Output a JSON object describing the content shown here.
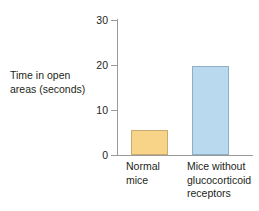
{
  "chart_data": {
    "type": "bar",
    "title": "",
    "xlabel": "",
    "ylabel": "Time in open\nareas (seconds)",
    "categories": [
      "Normal\nmice",
      "Mice without\nglucocorticoid\nreceptors"
    ],
    "category_names": [
      "Normal mice",
      "Mice without glucocorticoid receptors"
    ],
    "values": [
      5.5,
      19.8
    ],
    "ylim": [
      0,
      30
    ],
    "yticks": [
      0,
      10,
      20,
      30
    ],
    "ytick_labels": [
      "0",
      "10",
      "20",
      "30"
    ],
    "grid": false,
    "legend": false,
    "bar_colors": [
      "#f7d488",
      "#b9d9ef"
    ],
    "bar_border_colors": [
      "#c9ab72",
      "#8fafc6"
    ],
    "axis_color": "#9a9a9a",
    "text_color": "#231f20",
    "background": "#ffffff"
  },
  "axis": {
    "y_label_text": "Time in open\nareas (seconds)",
    "ticks": [
      {
        "value": 30,
        "label": "30"
      },
      {
        "value": 20,
        "label": "20"
      },
      {
        "value": 10,
        "label": "10"
      },
      {
        "value": 0,
        "label": "0"
      }
    ]
  },
  "bars": [
    {
      "key": "normal-mice",
      "label": "Normal\nmice",
      "value": 5.5
    },
    {
      "key": "ko-mice",
      "label": "Mice without\nglucocorticoid\nreceptors",
      "value": 19.8
    }
  ]
}
